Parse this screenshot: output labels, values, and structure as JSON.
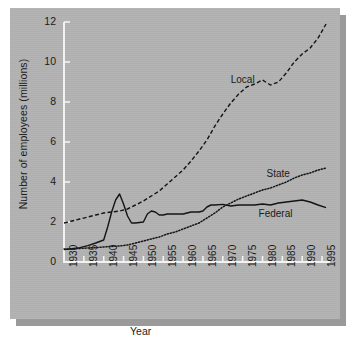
{
  "chart_data": {
    "type": "line",
    "title": "",
    "xlabel": "Year",
    "ylabel": "Number of employees (millions)",
    "xlim": [
      1930,
      1997
    ],
    "ylim": [
      0,
      12
    ],
    "xticks": [
      1930,
      1935,
      1940,
      1945,
      1950,
      1955,
      1960,
      1965,
      1970,
      1975,
      1980,
      1985,
      1990,
      1995
    ],
    "yticks": [
      0,
      2,
      4,
      6,
      8,
      10,
      12
    ],
    "grid": false,
    "legend_position": "inline-annotations",
    "annotations": [
      {
        "text": "Local",
        "x": 1972,
        "y": 9.05
      },
      {
        "text": "State",
        "x": 1981,
        "y": 4.35
      },
      {
        "text": "Federal",
        "x": 1979,
        "y": 2.35
      }
    ],
    "series": [
      {
        "name": "Local",
        "style": "dashed",
        "color": "#141414",
        "x": [
          1930,
          1932,
          1934,
          1936,
          1938,
          1940,
          1942,
          1944,
          1946,
          1948,
          1950,
          1952,
          1954,
          1956,
          1958,
          1960,
          1962,
          1964,
          1966,
          1968,
          1970,
          1972,
          1974,
          1976,
          1978,
          1980,
          1982,
          1984,
          1986,
          1988,
          1990,
          1992,
          1994,
          1996
        ],
        "values": [
          1.95,
          2.05,
          2.15,
          2.25,
          2.35,
          2.45,
          2.5,
          2.55,
          2.65,
          2.85,
          3.05,
          3.3,
          3.55,
          3.9,
          4.25,
          4.6,
          5.05,
          5.55,
          6.1,
          6.8,
          7.4,
          7.95,
          8.4,
          8.75,
          8.9,
          9.1,
          8.85,
          9.0,
          9.45,
          10.0,
          10.4,
          10.7,
          11.2,
          11.9
        ]
      },
      {
        "name": "State",
        "style": "dotted",
        "color": "#141414",
        "x": [
          1930,
          1932,
          1934,
          1936,
          1938,
          1940,
          1942,
          1944,
          1946,
          1948,
          1950,
          1952,
          1954,
          1956,
          1958,
          1960,
          1962,
          1964,
          1966,
          1968,
          1970,
          1972,
          1974,
          1976,
          1978,
          1980,
          1982,
          1984,
          1986,
          1988,
          1990,
          1992,
          1994,
          1996
        ],
        "values": [
          0.65,
          0.65,
          0.68,
          0.7,
          0.72,
          0.75,
          0.78,
          0.8,
          0.85,
          0.95,
          1.05,
          1.15,
          1.25,
          1.4,
          1.5,
          1.65,
          1.8,
          1.95,
          2.2,
          2.45,
          2.75,
          2.95,
          3.15,
          3.3,
          3.45,
          3.6,
          3.7,
          3.85,
          4.0,
          4.2,
          4.35,
          4.45,
          4.6,
          4.7
        ]
      },
      {
        "name": "Federal",
        "style": "solid",
        "color": "#141414",
        "x": [
          1930,
          1932,
          1934,
          1936,
          1938,
          1940,
          1941,
          1942,
          1943,
          1944,
          1945,
          1946,
          1947,
          1948,
          1950,
          1951,
          1952,
          1953,
          1954,
          1955,
          1956,
          1958,
          1960,
          1962,
          1964,
          1965,
          1966,
          1967,
          1968,
          1970,
          1972,
          1974,
          1976,
          1978,
          1980,
          1982,
          1984,
          1986,
          1988,
          1990,
          1992,
          1994,
          1996
        ],
        "values": [
          0.62,
          0.66,
          0.72,
          0.82,
          0.95,
          1.1,
          1.75,
          2.5,
          3.1,
          3.4,
          2.9,
          2.3,
          1.95,
          1.95,
          2.0,
          2.4,
          2.55,
          2.5,
          2.35,
          2.35,
          2.4,
          2.4,
          2.4,
          2.5,
          2.5,
          2.55,
          2.75,
          2.85,
          2.85,
          2.88,
          2.8,
          2.85,
          2.85,
          2.85,
          2.9,
          2.85,
          2.95,
          3.0,
          3.05,
          3.1,
          3.0,
          2.85,
          2.72
        ]
      }
    ]
  },
  "axis": {
    "y_tick_labels": [
      "0",
      "2",
      "4",
      "6",
      "8",
      "10",
      "12"
    ],
    "x_tick_labels": [
      "1930",
      "1935",
      "1940",
      "1945",
      "1950",
      "1955",
      "1960",
      "1965",
      "1970",
      "1975",
      "1980",
      "1985",
      "1990",
      "1995"
    ],
    "y_title": "Number of employees (millions)",
    "x_title": "Year"
  },
  "colors": {
    "panel": "#b3b3b3",
    "shadow": "#9a9a9a",
    "ink": "#141414",
    "page": "#ffffff"
  }
}
